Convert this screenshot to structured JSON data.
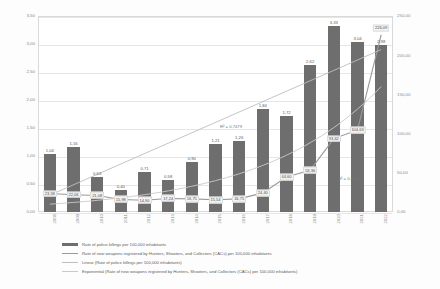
{
  "chart_data": {
    "type": "bar",
    "title": "",
    "xlabel": "",
    "ylabel": "",
    "categories": [
      "2008",
      "2009",
      "2010",
      "2011",
      "2012",
      "2013",
      "2014",
      "2015",
      "2016",
      "2017",
      "2018",
      "2019",
      "2020",
      "2021",
      "2022"
    ],
    "axis_left": {
      "ticks": [
        "0,00",
        "0,50",
        "1,00",
        "1,50",
        "2,00",
        "2,50",
        "3,00",
        "3,50"
      ],
      "min": 0,
      "max": 3.5
    },
    "axis_right": {
      "ticks": [
        "0,00",
        "50,00",
        "100,00",
        "150,00",
        "200,00",
        "250,00"
      ],
      "min": 0,
      "max": 250
    },
    "grid": true,
    "legend_position": "bottom",
    "series": [
      {
        "name": "Rate of police killings per 100,000 inhabitants",
        "type": "bar",
        "axis": "left",
        "color": "#6e6e6e",
        "values": [
          1.04,
          1.16,
          0.63,
          0.4,
          0.71,
          0.58,
          0.9,
          1.21,
          1.26,
          1.84,
          1.72,
          2.62,
          3.33,
          3.04,
          2.98
        ],
        "labels": [
          "1,04",
          "1,16",
          "0,63",
          "0,40",
          "0,71",
          "0,58",
          "0,90",
          "1,21",
          "1,26",
          "1,84",
          "1,72",
          "2,62",
          "3,33",
          "3,04",
          "2,98"
        ]
      },
      {
        "name": "Rate of new weapons registered by Hunters, Shooters, and Collectors (CACs) per 100,000 inhabitants",
        "type": "line",
        "axis": "right",
        "color": "#9a9a9a",
        "values": [
          23.58,
          22.06,
          21.08,
          15.98,
          14.9,
          17.24,
          16.75,
          15.54,
          16.75,
          24.4,
          44.6,
          53.36,
          93.62,
          104.63,
          226.09
        ],
        "labels": [
          "23,58",
          "22,06",
          "21,08",
          "15,98",
          "14,90",
          "17,24",
          "16,75",
          "15,54",
          "16,75",
          "24,40",
          "44,60",
          "53,36",
          "93,62",
          "104,63",
          "226,09"
        ]
      },
      {
        "name": "Linear (Rate of police killings per 100,000 inhabitants)",
        "type": "trendline-linear",
        "axis": "left",
        "color": "#bdbdbd",
        "r2_label": "R² = 0,7479",
        "start_value": 0.3,
        "end_value": 2.9
      },
      {
        "name": "Exponential (Rate of new weapons registered by Hunters, Shooters, and Collectors (CACs) per 100,000 inhabitants)",
        "type": "trendline-exponential",
        "axis": "right",
        "color": "#c9c9c9",
        "r2_label": "R² = 0,6402",
        "start_value": 10.0,
        "end_value": 160.0
      }
    ]
  },
  "legend": {
    "items": [
      "Rate of police killings per 100,000 inhabitants",
      "Rate of new weapons registered by Hunters, Shooters, and Collectors (CACs) per 100,000 inhabitants",
      "Linear (Rate of police killings per 100,000 inhabitants)",
      "Exponential (Rate of new weapons registered by Hunters, Shooters, and Collectors (CACs) per 100,000 inhabitants)"
    ]
  },
  "annotations": {
    "r2_linear": "R² = 0,7479",
    "r2_exponential": "R² = 0,6402"
  }
}
